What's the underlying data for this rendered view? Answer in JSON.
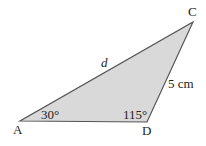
{
  "diagram": {
    "type": "triangle",
    "fill_color": "#d9d9d9",
    "stroke_color": "#555555",
    "vertices": {
      "A": {
        "label": "A",
        "x": 20,
        "y": 121
      },
      "D": {
        "label": "D",
        "x": 147,
        "y": 122
      },
      "C": {
        "label": "C",
        "x": 193,
        "y": 22
      }
    },
    "side_labels": {
      "AC": "d",
      "DC": "5 cm"
    },
    "angle_labels": {
      "A": "30°",
      "D": "115°"
    }
  }
}
